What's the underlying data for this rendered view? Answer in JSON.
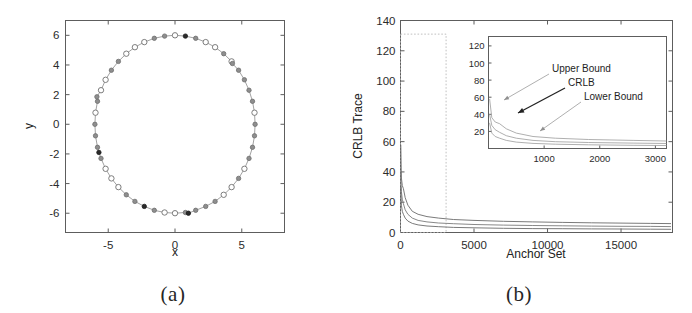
{
  "figure": {
    "panels": [
      {
        "id": "a",
        "caption": "(a)"
      },
      {
        "id": "b",
        "caption": "(b)"
      }
    ]
  },
  "panel_a": {
    "xlabel": "x",
    "ylabel": "y",
    "xticks": [
      "-5",
      "0",
      "5"
    ],
    "yticks": [
      "6",
      "4",
      "2",
      "0",
      "-2",
      "-4",
      "-6"
    ]
  },
  "panel_b": {
    "xlabel": "Anchor Set",
    "ylabel": "CRLB Trace",
    "xticks": [
      "0",
      "5000",
      "10000",
      "15000"
    ],
    "yticks": [
      "140",
      "120",
      "100",
      "80",
      "60",
      "40",
      "20",
      "0"
    ],
    "inset": {
      "xticks": [
        "1000",
        "2000",
        "3000"
      ],
      "yticks": [
        "120",
        "100",
        "80",
        "60",
        "40",
        "20"
      ],
      "annotations": [
        "Upper Bound",
        "CRLB",
        "Lower Bound"
      ]
    }
  },
  "chart_data": [
    {
      "type": "scatter",
      "title": "",
      "xlabel": "x",
      "ylabel": "y",
      "xlim": [
        -8.2,
        8.2
      ],
      "ylim": [
        -7.3,
        7.0
      ],
      "xticks": [
        -5,
        0,
        5
      ],
      "yticks": [
        -6,
        -4,
        -2,
        0,
        2,
        4,
        6
      ],
      "grid": false,
      "legend": "none",
      "description": "Anchor node positions distributed around a circle of radius approximately 6 centred near the origin, connected by a faint line; markers are a mix of open circles, grey-filled circles and a few dark-filled circles.",
      "series": [
        {
          "name": "Anchor positions (circle radius 6)",
          "marker_styles": [
            "open",
            "grey",
            "dark"
          ],
          "points": [
            {
              "x": 6.0,
              "y": 0.0,
              "style": "grey"
            },
            {
              "x": 5.95,
              "y": 0.78,
              "style": "open"
            },
            {
              "x": 5.8,
              "y": 1.55,
              "style": "grey"
            },
            {
              "x": 5.54,
              "y": 2.3,
              "style": "grey"
            },
            {
              "x": 5.2,
              "y": 3.0,
              "style": "grey"
            },
            {
              "x": 4.76,
              "y": 3.65,
              "style": "grey"
            },
            {
              "x": 4.24,
              "y": 4.24,
              "style": "open"
            },
            {
              "x": 3.65,
              "y": 4.76,
              "style": "grey"
            },
            {
              "x": 3.0,
              "y": 5.2,
              "style": "open"
            },
            {
              "x": 2.3,
              "y": 5.54,
              "style": "open"
            },
            {
              "x": 1.55,
              "y": 5.8,
              "style": "grey"
            },
            {
              "x": 0.78,
              "y": 5.95,
              "style": "dark"
            },
            {
              "x": 0.0,
              "y": 6.0,
              "style": "open"
            },
            {
              "x": -0.78,
              "y": 5.95,
              "style": "grey"
            },
            {
              "x": -1.55,
              "y": 5.8,
              "style": "grey"
            },
            {
              "x": -2.3,
              "y": 5.54,
              "style": "open"
            },
            {
              "x": -3.0,
              "y": 5.2,
              "style": "open"
            },
            {
              "x": -3.65,
              "y": 4.76,
              "style": "open"
            },
            {
              "x": -4.24,
              "y": 4.24,
              "style": "grey"
            },
            {
              "x": -4.76,
              "y": 3.65,
              "style": "grey"
            },
            {
              "x": -5.2,
              "y": 3.0,
              "style": "open"
            },
            {
              "x": -5.54,
              "y": 2.3,
              "style": "open"
            },
            {
              "x": -5.8,
              "y": 1.55,
              "style": "grey"
            },
            {
              "x": -5.95,
              "y": 0.78,
              "style": "open"
            },
            {
              "x": -6.0,
              "y": 0.0,
              "style": "grey"
            },
            {
              "x": -5.95,
              "y": -0.78,
              "style": "grey"
            },
            {
              "x": -5.8,
              "y": -1.55,
              "style": "grey"
            },
            {
              "x": -5.7,
              "y": -1.9,
              "style": "dark"
            },
            {
              "x": -5.54,
              "y": -2.3,
              "style": "grey"
            },
            {
              "x": -5.2,
              "y": -3.0,
              "style": "open"
            },
            {
              "x": -4.76,
              "y": -3.65,
              "style": "open"
            },
            {
              "x": -4.24,
              "y": -4.24,
              "style": "open"
            },
            {
              "x": -3.65,
              "y": -4.76,
              "style": "grey"
            },
            {
              "x": -3.0,
              "y": -5.2,
              "style": "grey"
            },
            {
              "x": -2.3,
              "y": -5.54,
              "style": "dark"
            },
            {
              "x": -1.55,
              "y": -5.8,
              "style": "grey"
            },
            {
              "x": -0.78,
              "y": -5.95,
              "style": "open"
            },
            {
              "x": 0.0,
              "y": -6.0,
              "style": "open"
            },
            {
              "x": 0.78,
              "y": -5.95,
              "style": "grey"
            },
            {
              "x": 1.0,
              "y": -6.0,
              "style": "dark"
            },
            {
              "x": 1.55,
              "y": -5.8,
              "style": "grey"
            },
            {
              "x": 2.3,
              "y": -5.54,
              "style": "grey"
            },
            {
              "x": 3.0,
              "y": -5.2,
              "style": "grey"
            },
            {
              "x": 3.65,
              "y": -4.76,
              "style": "open"
            },
            {
              "x": 4.24,
              "y": -4.24,
              "style": "open"
            },
            {
              "x": 4.76,
              "y": -3.65,
              "style": "grey"
            },
            {
              "x": 5.2,
              "y": -3.0,
              "style": "open"
            },
            {
              "x": 5.54,
              "y": -2.3,
              "style": "grey"
            },
            {
              "x": 5.8,
              "y": -1.55,
              "style": "grey"
            },
            {
              "x": 5.95,
              "y": -0.78,
              "style": "grey"
            },
            {
              "x": 4.3,
              "y": 4.1,
              "style": "grey"
            },
            {
              "x": -5.85,
              "y": 1.85,
              "style": "grey"
            }
          ]
        }
      ]
    },
    {
      "type": "line",
      "title": "",
      "xlabel": "Anchor Set",
      "ylabel": "CRLB Trace",
      "xlim": [
        0,
        18500
      ],
      "ylim": [
        0,
        140
      ],
      "xticks": [
        0,
        5000,
        10000,
        15000
      ],
      "yticks": [
        0,
        20,
        40,
        60,
        80,
        100,
        120,
        140
      ],
      "grid": false,
      "legend": "inset annotations",
      "guide_rectangle": {
        "x": [
          0,
          3100
        ],
        "y": [
          0,
          131
        ]
      },
      "series": [
        {
          "name": "Upper Bound",
          "x": [
            20,
            60,
            120,
            200,
            320,
            500,
            800,
            1200,
            1800,
            2600,
            3600,
            5000,
            7000,
            9000,
            11000,
            13000,
            15000,
            17000,
            18400
          ],
          "y": [
            58,
            36,
            31,
            29,
            23,
            18,
            14,
            12,
            10.5,
            9.5,
            8.6,
            8.0,
            7.4,
            7.0,
            6.7,
            6.4,
            6.2,
            6.0,
            5.9
          ]
        },
        {
          "name": "CRLB",
          "x": [
            20,
            60,
            120,
            200,
            320,
            500,
            800,
            1200,
            1800,
            2600,
            3600,
            5000,
            7000,
            9000,
            11000,
            13000,
            15000,
            17000,
            18400
          ],
          "y": [
            40,
            27,
            22,
            19,
            15,
            12,
            9.5,
            8.0,
            7.0,
            6.3,
            5.8,
            5.3,
            4.9,
            4.6,
            4.4,
            4.2,
            4.1,
            4.0,
            3.9
          ]
        },
        {
          "name": "Lower Bound",
          "x": [
            20,
            60,
            120,
            200,
            320,
            500,
            800,
            1200,
            1800,
            2600,
            3600,
            5000,
            7000,
            9000,
            11000,
            13000,
            15000,
            17000,
            18400
          ],
          "y": [
            30,
            18,
            14,
            12,
            9.5,
            7.5,
            6.0,
            5.0,
            4.3,
            3.8,
            3.4,
            3.1,
            2.8,
            2.6,
            2.5,
            2.4,
            2.3,
            2.2,
            2.1
          ]
        }
      ],
      "inset": {
        "xlim": [
          0,
          3200
        ],
        "ylim": [
          0,
          131
        ],
        "xticks": [
          1000,
          2000,
          3000
        ],
        "yticks": [
          20,
          40,
          60,
          80,
          100,
          120
        ],
        "annotations": [
          {
            "label": "Upper Bound",
            "target_series": "Upper Bound"
          },
          {
            "label": "CRLB",
            "target_series": "CRLB"
          },
          {
            "label": "Lower Bound",
            "target_series": "Lower Bound"
          }
        ]
      }
    }
  ]
}
